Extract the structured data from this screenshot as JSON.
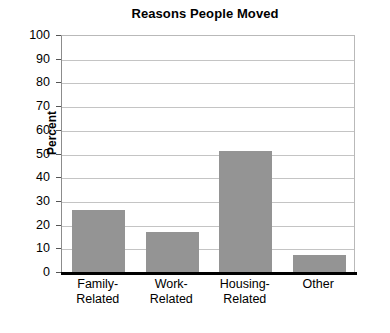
{
  "chart_data": {
    "type": "bar",
    "title": "Reasons People Moved",
    "xlabel": "",
    "ylabel": "Percent",
    "categories": [
      "Family-Related",
      "Work-Related",
      "Housing-Related",
      "Other"
    ],
    "category_lines": [
      [
        "Family-",
        "Related"
      ],
      [
        "Work-",
        "Related"
      ],
      [
        "Housing-",
        "Related"
      ],
      [
        "Other",
        ""
      ]
    ],
    "values": [
      26,
      17,
      51,
      7
    ],
    "ylim": [
      0,
      100
    ],
    "yticks": [
      100,
      90,
      80,
      70,
      60,
      50,
      40,
      30,
      20,
      10,
      0
    ],
    "ytick_labels": [
      "100",
      "90",
      "80",
      "70",
      "60",
      "50",
      "40",
      "30",
      "20",
      "10",
      "0"
    ],
    "grid": true,
    "legend": false,
    "colors": {
      "bar_fill": "#949494",
      "gridline": "#c4c4c4",
      "axis": "#000000",
      "plot_border": "#b9b9b9",
      "background": "#ffffff",
      "text": "#000000"
    }
  }
}
